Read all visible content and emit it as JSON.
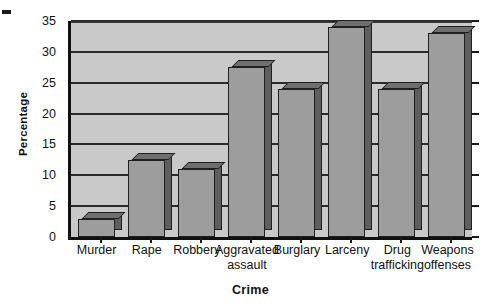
{
  "chart_data": {
    "type": "bar",
    "title": "",
    "xlabel": "Crime",
    "ylabel": "Percentage",
    "categories": [
      "Murder",
      "Rape",
      "Robbery",
      "Aggravated assault",
      "Burglary",
      "Larceny",
      "Drug trafficking",
      "Weapons offenses"
    ],
    "category_lines": [
      [
        "Murder",
        ""
      ],
      [
        "Rape",
        ""
      ],
      [
        "Robbery",
        ""
      ],
      [
        "Aggravated",
        "assault"
      ],
      [
        "Burglary",
        ""
      ],
      [
        "Larceny",
        ""
      ],
      [
        "Drug",
        "trafficking"
      ],
      [
        "Weapons",
        "offenses"
      ]
    ],
    "values": [
      3,
      12.5,
      11,
      27.5,
      24,
      34,
      24,
      33
    ],
    "ylim": [
      0,
      35
    ],
    "yticks": [
      0,
      5,
      10,
      15,
      20,
      25,
      30,
      35
    ],
    "ytick_labels": [
      "0",
      "5",
      "10",
      "15",
      "20",
      "25",
      "30",
      "35"
    ],
    "grid": true,
    "legend": false,
    "style": "3d-bar",
    "colors": {
      "bar_front": "#9d9d9d",
      "bar_top": "#6f6f6f",
      "bar_side": "#5e5e5e",
      "plot_background": "#c9c9c9",
      "gridline": "#2b2b2b",
      "axis": "#111111",
      "page_background": "#ffffff",
      "text": "#111111"
    }
  }
}
